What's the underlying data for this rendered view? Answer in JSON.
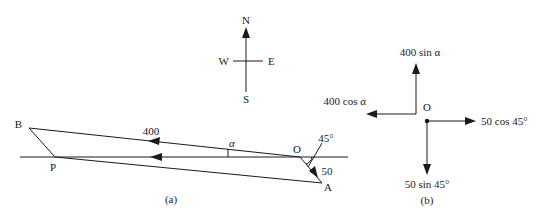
{
  "compass": {
    "north": "N",
    "south": "S",
    "east": "E",
    "west": "W"
  },
  "panel_a": {
    "caption": "(a)",
    "points": {
      "B": "B",
      "P": "P",
      "O": "O",
      "A": "A"
    },
    "velocity_label": "400",
    "current_label": "50",
    "angle_alpha": "α",
    "angle_45": "45°"
  },
  "panel_b": {
    "caption": "(b)",
    "origin": "O",
    "up_label": "400 sin α",
    "left_label": "400 cos α",
    "right_label": "50 cos 45°",
    "down_label": "50 sin 45°"
  },
  "colors": {
    "ink": "#1a1a1a",
    "background": "#ffffff"
  }
}
